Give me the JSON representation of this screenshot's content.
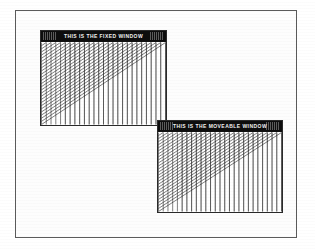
{
  "screen": {
    "width": 315,
    "height": 249,
    "background_color": "#ffffff",
    "frame_color": "#5a5a5a"
  },
  "page_frame": {
    "name": "outer-page-border"
  },
  "windows": [
    {
      "id": "fixed",
      "title": "THIS IS THE FIXED WINDOW",
      "title_bar_color": "#0d0d0d",
      "title_text_color": "#f2f2f2",
      "border_color": "#2a2a2a",
      "client_background": "#ffffff",
      "x": 40,
      "y": 30,
      "width": 127,
      "height": 96,
      "z_order": 1,
      "graphic": {
        "type": "string-art-envelope",
        "line_count": 26,
        "line_color": "#111111"
      }
    },
    {
      "id": "moveable",
      "title": "THIS IS THE MOVEABLE WINDOW",
      "title_bar_color": "#0d0d0d",
      "title_text_color": "#f2f2f2",
      "border_color": "#2a2a2a",
      "client_background": "#ffffff",
      "x": 157,
      "y": 120,
      "width": 126,
      "height": 93,
      "z_order": 2,
      "graphic": {
        "type": "string-art-envelope",
        "line_count": 26,
        "line_color": "#111111"
      }
    }
  ]
}
